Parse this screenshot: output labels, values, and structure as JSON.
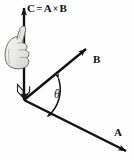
{
  "figure": {
    "background_color": "#fefefe",
    "ink_color": "#111111",
    "hand_fill_color": "#e9e9e7",
    "hand_outline_color": "#555555"
  },
  "labels": {
    "result_vector": "C",
    "equals": "=",
    "first_vector": "A",
    "cross_symbol": "×",
    "second_vector": "B",
    "equation": "C = A × B",
    "vector_b": "B",
    "vector_a": "A",
    "angle": "θ"
  },
  "elements": {
    "c_axis_name": "vertical vector C arrow",
    "b_axis_name": "vector B arrow",
    "a_axis_name": "vector A arrow",
    "angle_arc_name": "angle theta arc between A and B",
    "hand_name": "right hand thumb up illustration",
    "curl_name": "curl arrow at origin of C axis"
  },
  "geometry": {
    "origin": {
      "x": 24,
      "y": 100
    },
    "c_tip": {
      "x": 24,
      "y": 3
    },
    "b_tip": {
      "x": 90,
      "y": 46
    },
    "a_tip": {
      "x": 130,
      "y": 154
    }
  }
}
